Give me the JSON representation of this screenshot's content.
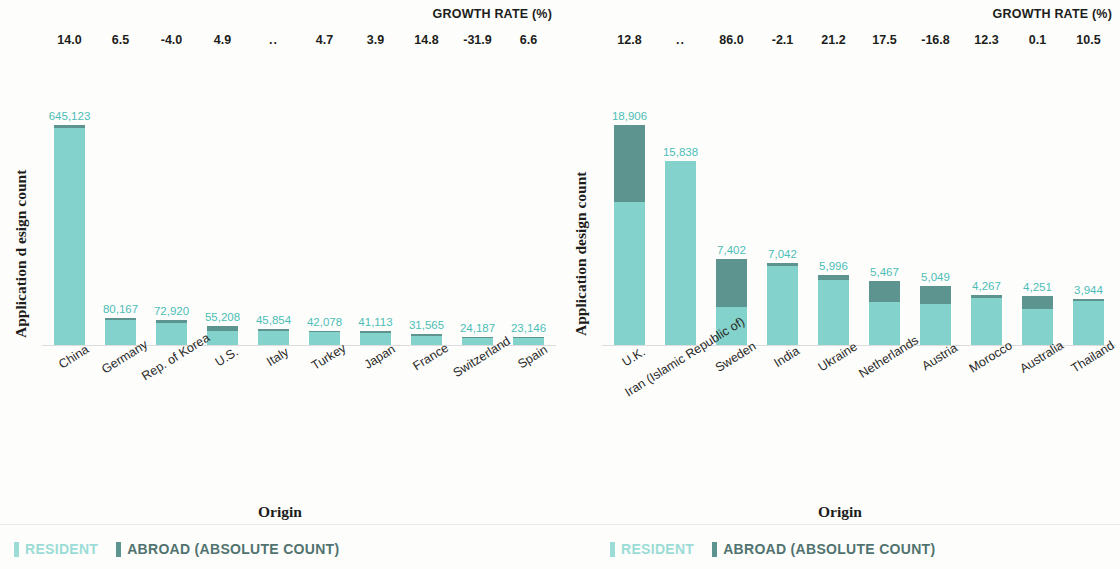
{
  "chart_data": [
    {
      "type": "bar",
      "panel": "left",
      "title": "",
      "growth_header": "GROWTH RATE (%)",
      "ylabel": "Application d esign count",
      "xlabel": "Origin",
      "stacked": true,
      "categories": [
        "China",
        "Germany",
        "Rep. of Korea",
        "U.S.",
        "Italy",
        "Turkey",
        "Japan",
        "France",
        "Switzerland",
        "Spain"
      ],
      "totals": [
        645123,
        80167,
        72920,
        55208,
        45854,
        42078,
        41113,
        31565,
        24187,
        23146
      ],
      "total_labels": [
        "645,123",
        "80,167",
        "72,920",
        "55,208",
        "45,854",
        "42,078",
        "41,113",
        "31,565",
        "24,187",
        "23,146"
      ],
      "growth_rates": [
        "14.0",
        "6.5",
        "-4.0",
        "4.9",
        "..",
        "4.7",
        "3.9",
        "14.8",
        "-31.9",
        "6.6"
      ],
      "series": [
        {
          "name": "RESIDENT",
          "color": "#83d2cb",
          "values": [
            635000,
            72000,
            66000,
            41000,
            41000,
            37500,
            35000,
            27500,
            19500,
            20000
          ]
        },
        {
          "name": "ABROAD (ABSOLUTE COUNT)",
          "color": "#5d948f",
          "values": [
            10123,
            8167,
            6920,
            14208,
            4854,
            4578,
            6113,
            4065,
            4687,
            3146
          ]
        }
      ],
      "legend": [
        {
          "label": "RESIDENT",
          "color": "#9bdcd6"
        },
        {
          "label": "ABROAD (ABSOLUTE COUNT)",
          "color": "#5d948f"
        }
      ],
      "ylim": [
        0,
        645123
      ],
      "grid": false
    },
    {
      "type": "bar",
      "panel": "right",
      "title": "",
      "growth_header": "GROWTH RATE (%)",
      "ylabel": "Application design count",
      "xlabel": "Origin",
      "stacked": true,
      "categories": [
        "U.K.",
        "Iran (Islamic Republic of)",
        "Sweden",
        "India",
        "Ukraine",
        "Netherlands",
        "Austria",
        "Morocco",
        "Australia",
        "Thailand"
      ],
      "totals": [
        18906,
        15838,
        7402,
        7042,
        5996,
        5467,
        5049,
        4267,
        4251,
        3944
      ],
      "total_labels": [
        "18,906",
        "15,838",
        "7,402",
        "7,042",
        "5,996",
        "5,467",
        "5,049",
        "4,267",
        "4,251",
        "3,944"
      ],
      "growth_rates": [
        "12.8",
        "..",
        "86.0",
        "-2.1",
        "21.2",
        "17.5",
        "-16.8",
        "12.3",
        "0.1",
        "10.5"
      ],
      "series": [
        {
          "name": "RESIDENT",
          "color": "#83d2cb",
          "values": [
            12300,
            15838,
            3300,
            6750,
            5580,
            3700,
            3500,
            4000,
            3100,
            3800
          ]
        },
        {
          "name": "ABROAD (ABSOLUTE COUNT)",
          "color": "#5d948f",
          "values": [
            6606,
            0,
            4102,
            292,
            416,
            1767,
            1549,
            267,
            1151,
            144
          ]
        }
      ],
      "legend": [
        {
          "label": "RESIDENT",
          "color": "#9bdcd6"
        },
        {
          "label": "ABROAD (ABSOLUTE COUNT)",
          "color": "#5d948f"
        }
      ],
      "ylim": [
        0,
        18906
      ],
      "grid": false
    }
  ]
}
